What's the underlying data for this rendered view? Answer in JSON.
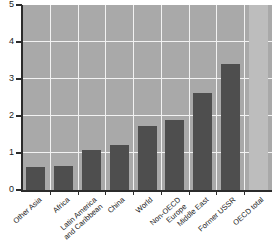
{
  "chart_data": {
    "type": "bar",
    "title": "",
    "subtitle": "",
    "xlabel": "",
    "ylabel": "",
    "categories": [
      "Other Asia",
      "Africa",
      "Latin America\nand Caribbean",
      "China",
      "World",
      "Non-OECD Europe",
      "Middle East",
      "Former USSR",
      "OECD total"
    ],
    "values": [
      0.61,
      0.65,
      1.08,
      1.22,
      1.73,
      1.89,
      2.62,
      3.41,
      5.0
    ],
    "offscale_flags": [
      false,
      false,
      false,
      false,
      false,
      false,
      false,
      false,
      true
    ],
    "ylim": [
      0,
      5
    ],
    "yticks": [
      0,
      1,
      2,
      3,
      4,
      5
    ],
    "ytick_labels": [
      "0",
      "1",
      "2",
      "3",
      "4",
      "5"
    ],
    "grid": true,
    "grid_axis": "both",
    "legend": "none",
    "annotations": []
  },
  "style": {
    "plot_background": "#a9a9a9",
    "grid_color": "#f2f2f2",
    "bar_color": "#4e4e4e",
    "offscale_bar_color": "#bdbdbd",
    "axis_color": "#2b2b2b",
    "text_color": "#1a1a1a",
    "page_background": "#ffffff"
  }
}
